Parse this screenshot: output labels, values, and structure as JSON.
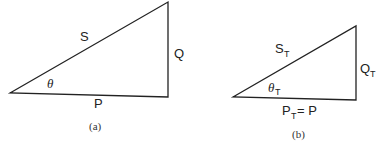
{
  "figure": {
    "panel_a": {
      "caption": "(a)",
      "hypotenuse_label": "S",
      "vertical_label": "Q",
      "base_label": "P",
      "angle_label": "θ"
    },
    "panel_b": {
      "caption": "(b)",
      "hypotenuse_label": "S",
      "hypotenuse_sub": "T",
      "vertical_label": "Q",
      "vertical_sub": "T",
      "base_label": "P",
      "base_sub": "T",
      "base_suffix": " = P",
      "angle_label": "θ",
      "angle_sub": "T"
    },
    "stroke_color": "#222222"
  }
}
